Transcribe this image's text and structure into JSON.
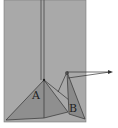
{
  "diagram": {
    "panel_color": "#a9a9a9",
    "background": "#ffffff",
    "line_color": "#333333",
    "triangle_a_fill": "#8f8f8f",
    "triangle_b_fill": "#8a8a8a",
    "labels": {
      "a": "A",
      "b": "B"
    }
  }
}
